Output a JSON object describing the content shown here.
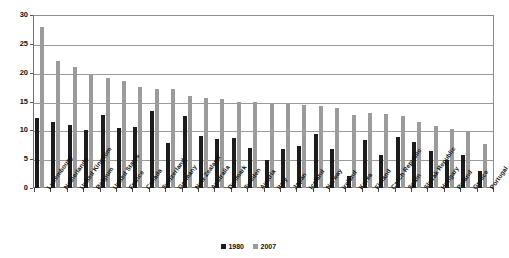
{
  "chart_data": {
    "type": "bar",
    "title": "",
    "subtitle": "",
    "xlabel": "",
    "ylabel": "",
    "ylim": [
      0,
      30
    ],
    "yticks": [
      0,
      5,
      10,
      15,
      20,
      25,
      30
    ],
    "grid": true,
    "legend_position": "bottom",
    "categories": [
      "Luxembourg",
      "Netherlands",
      "United Kingdom",
      "Belgium",
      "United States",
      "France",
      "Canada",
      "Switzerland",
      "Germany",
      "New Zealand",
      "Australia",
      "Denmark",
      "Sweden",
      "Austria",
      "Italy",
      "Japan",
      "Iceland",
      "Norway",
      "Ireland",
      "Korea",
      "Finland",
      "Czech Republic",
      "Spain",
      "Slovak Republic",
      "Hungary",
      "Poland",
      "Greece",
      "Portugal"
    ],
    "series": [
      {
        "name": "1980",
        "color": "#1c1c1c",
        "values": [
          12.1,
          11.5,
          11.0,
          10.0,
          12.7,
          10.4,
          10.6,
          13.3,
          7.8,
          12.5,
          9.1,
          8.5,
          8.7,
          7.0,
          4.9,
          6.7,
          7.2,
          9.3,
          6.8,
          2.1,
          8.3,
          5.8,
          8.9,
          7.9,
          6.4,
          4.8,
          5.7,
          3.0
        ]
      },
      {
        "name": "2007",
        "color": "#9b9b9b",
        "values": [
          27.9,
          22.0,
          20.9,
          19.8,
          19.0,
          18.5,
          17.5,
          17.2,
          17.1,
          15.9,
          15.6,
          15.5,
          15.0,
          14.9,
          14.6,
          14.5,
          14.4,
          14.2,
          13.9,
          12.6,
          13.0,
          12.9,
          12.5,
          11.5,
          10.8,
          10.3,
          9.8,
          7.6
        ]
      }
    ]
  },
  "legend": {
    "items": [
      {
        "label": "1980",
        "color": "#1c1c1c"
      },
      {
        "label": "2007",
        "color": "#9b9b9b"
      }
    ]
  }
}
